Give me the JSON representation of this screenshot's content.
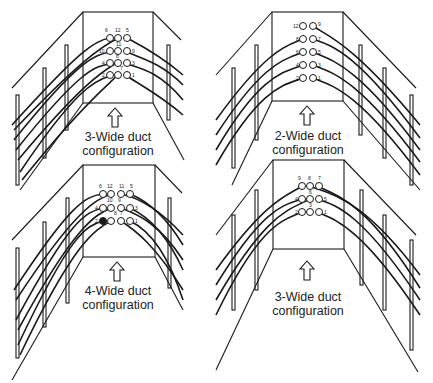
{
  "colors": {
    "ink": "#1a1a1a",
    "background": "#ffffff"
  },
  "panels": [
    {
      "id": "top-left",
      "caption_line1": "3-Wide duct",
      "caption_line2": "configuration",
      "duct_rows": [
        [
          "6",
          "12",
          "5"
        ],
        [
          "10",
          "11",
          "9"
        ],
        [
          "4",
          "8",
          "3"
        ],
        [
          "2",
          "7",
          "1"
        ]
      ]
    },
    {
      "id": "bottom-left",
      "caption_line1": "4-Wide duct",
      "caption_line2": "configuration",
      "duct_rows": [
        [
          "6",
          "12",
          "11",
          "5"
        ],
        [
          "4",
          "10",
          "9",
          "3"
        ],
        [
          "2",
          "8",
          "7",
          "1"
        ]
      ]
    },
    {
      "id": "top-right",
      "caption_line1": "2-Wide duct",
      "caption_line2": "configuration",
      "duct_rows": [
        [
          "12",
          "9"
        ],
        [
          "8",
          "7"
        ],
        [
          "6",
          "5"
        ],
        [
          "4",
          "3"
        ],
        [
          "2",
          "1"
        ]
      ]
    },
    {
      "id": "bottom-right",
      "caption_line1": "3-Wide duct",
      "caption_line2": "configuration",
      "duct_rows": [
        [
          "9",
          "8",
          "7"
        ],
        [
          "4",
          "6",
          "5"
        ],
        [
          "2",
          "3",
          "1"
        ]
      ]
    }
  ],
  "icons": {
    "arrow": "up-arrow-outline-icon"
  }
}
